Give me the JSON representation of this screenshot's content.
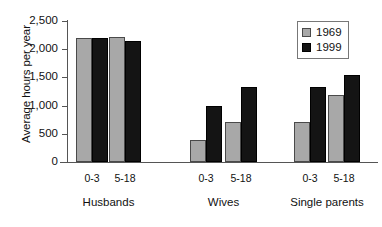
{
  "chart_data": {
    "type": "bar",
    "title": "",
    "xlabel": "",
    "ylabel": "Average hours per year",
    "ylim": [
      0,
      2500
    ],
    "ytick_labels": [
      "2,500",
      "2,000",
      "1,500",
      "1,000",
      "500",
      "0"
    ],
    "ytick_values": [
      2500,
      2000,
      1500,
      1000,
      500,
      0
    ],
    "grid": false,
    "legend_position": "top-right",
    "groups": [
      "Husbands",
      "Wives",
      "Single parents"
    ],
    "subcategories": [
      "0-3",
      "5-18"
    ],
    "categories": [
      "Husbands 0-3",
      "Husbands 5-18",
      "Wives 0-3",
      "Wives 5-18",
      "Single parents 0-3",
      "Single parents 5-18"
    ],
    "series": [
      {
        "name": "1969",
        "color": "#a8a8a8",
        "values": [
          2200,
          2220,
          390,
          710,
          710,
          1180
        ]
      },
      {
        "name": "1999",
        "color": "#141414",
        "values": [
          2200,
          2150,
          990,
          1330,
          1330,
          1550
        ]
      }
    ]
  },
  "legend": {
    "entries": [
      {
        "label": "1969"
      },
      {
        "label": "1999"
      }
    ]
  },
  "axis": {
    "y_title": "Average hours per year"
  }
}
